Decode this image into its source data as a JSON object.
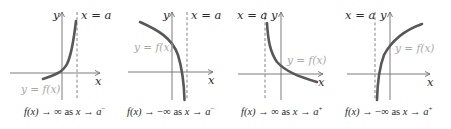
{
  "figure": {
    "panels": [
      {
        "asymptote_label": "x = a",
        "y_axis_label": "y",
        "x_axis_label": "x",
        "function_label": "y = f(x)",
        "caption": {
          "lhs": "f(x)",
          "arrow1": "→",
          "limit": "∞",
          "as": "as",
          "var": "x",
          "arrow2": "→",
          "approach": "a",
          "side": "−"
        }
      },
      {
        "asymptote_label": "x = a",
        "y_axis_label": "y",
        "x_axis_label": "x",
        "function_label": "y = f(x)",
        "caption": {
          "lhs": "f(x)",
          "arrow1": "→",
          "limit": "−∞",
          "as": "as",
          "var": "x",
          "arrow2": "→",
          "approach": "a",
          "side": "−"
        }
      },
      {
        "asymptote_label": "x = a",
        "y_axis_label": "y",
        "x_axis_label": "x",
        "function_label": "y = f(x)",
        "caption": {
          "lhs": "f(x)",
          "arrow1": "→",
          "limit": "∞",
          "as": "as",
          "var": "x",
          "arrow2": "→",
          "approach": "a",
          "side": "+"
        }
      },
      {
        "asymptote_label": "x = a",
        "y_axis_label": "y",
        "x_axis_label": "x",
        "function_label": "y = f(x)",
        "caption": {
          "lhs": "f(x)",
          "arrow1": "→",
          "limit": "−∞",
          "as": "as",
          "var": "x",
          "arrow2": "→",
          "approach": "a",
          "side": "+"
        }
      }
    ],
    "colors": {
      "curve": "#585858",
      "axis": "#6e6e6e",
      "function_label": "#a8a8a8",
      "text": "#2a2a2a"
    }
  }
}
